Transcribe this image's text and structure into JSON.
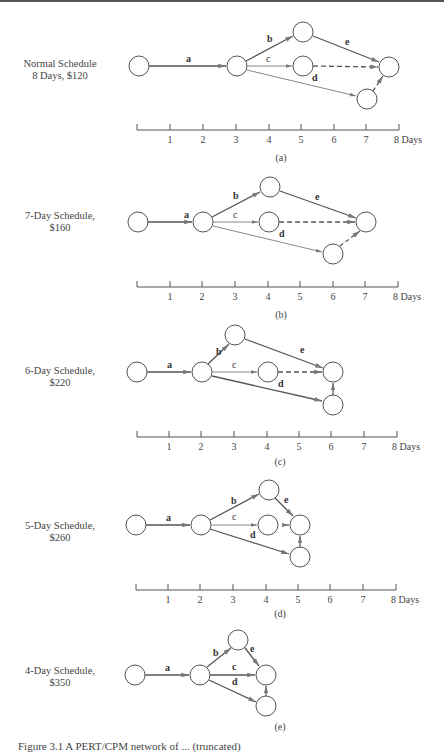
{
  "figure": {
    "panels": [
      {
        "id": "a",
        "title_line1": "Normal Schedule",
        "title_line2": "8 Days, $120",
        "sub": "(a)"
      },
      {
        "id": "b",
        "title_line1": "7-Day Schedule,",
        "title_line2": "$160",
        "sub": "(b)"
      },
      {
        "id": "c",
        "title_line1": "6-Day Schedule,",
        "title_line2": "$220",
        "sub": "(c)"
      },
      {
        "id": "d",
        "title_line1": "5-Day Schedule,",
        "title_line2": "$260",
        "sub": "(d)"
      },
      {
        "id": "e",
        "title_line1": "4-Day Schedule,",
        "title_line2": "$350",
        "sub": "(e)"
      }
    ],
    "axis": {
      "ticks": [
        "1",
        "2",
        "3",
        "4",
        "5",
        "6",
        "7",
        "8 Days"
      ]
    },
    "activities": [
      "a",
      "b",
      "c",
      "d",
      "e"
    ],
    "caption": "Figure 3.1   A PERT/CPM network of ... (truncated)"
  }
}
